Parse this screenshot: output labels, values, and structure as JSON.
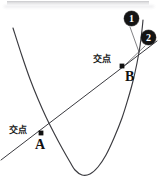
{
  "figure": {
    "background_color": "#ffffff",
    "ink_color": "#3a3a3f",
    "label_color": "#1b1b1b",
    "callout_fill": "#141414",
    "callout_text_color": "#ffffff",
    "width": 162,
    "height": 181
  },
  "labels": {
    "intersection_b": "交点",
    "intersection_a": "交点",
    "point_b": "B",
    "point_a": "A"
  },
  "callouts": [
    {
      "id": "callout-1",
      "text": "①",
      "numeral": "1",
      "target": "parabola"
    },
    {
      "id": "callout-2",
      "text": "②",
      "numeral": "2",
      "target": "line"
    }
  ],
  "chart_data": {
    "type": "line",
    "title": "交点",
    "xlabel": "",
    "ylabel": "",
    "grid": false,
    "legend": "none",
    "xlim": [
      0,
      162
    ],
    "ylim": [
      181,
      0
    ],
    "series": [
      {
        "name": "①",
        "kind": "parabola",
        "label": "curve-1",
        "points": [
          [
            13,
            28
          ],
          [
            22,
            56
          ],
          [
            30,
            79
          ],
          [
            38,
            99
          ],
          [
            46,
            117
          ],
          [
            54,
            133
          ],
          [
            62,
            148
          ],
          [
            70,
            162
          ],
          [
            75,
            170
          ],
          [
            82,
            175
          ],
          [
            90,
            174
          ],
          [
            98,
            167
          ],
          [
            106,
            155
          ],
          [
            114,
            138
          ],
          [
            122,
            118
          ],
          [
            128,
            99
          ],
          [
            133,
            81
          ],
          [
            137,
            63
          ],
          [
            140,
            46
          ],
          [
            142,
            30
          ],
          [
            143,
            20
          ]
        ],
        "vertex": [
          80,
          175
        ],
        "opens": "up"
      },
      {
        "name": "②",
        "kind": "line",
        "label": "line-2",
        "points": [
          [
            1,
            160
          ],
          [
            157,
            41
          ]
        ],
        "slope": -0.763
      }
    ],
    "annotations": [
      {
        "name": "A",
        "label": "交点",
        "marker": "square",
        "x": 41,
        "y": 133,
        "description": "lower-left intersection of the parabola and the line"
      },
      {
        "name": "B",
        "label": "交点",
        "marker": "square",
        "x": 122,
        "y": 66,
        "description": "upper-right intersection of the parabola and the line"
      }
    ],
    "leaders": [
      {
        "from": "callout-1",
        "x1": 130,
        "y1": 27,
        "x2": 139,
        "y2": 52
      },
      {
        "from": "callout-2",
        "x1": 145,
        "y1": 46,
        "x2": 125,
        "y2": 65
      }
    ]
  }
}
